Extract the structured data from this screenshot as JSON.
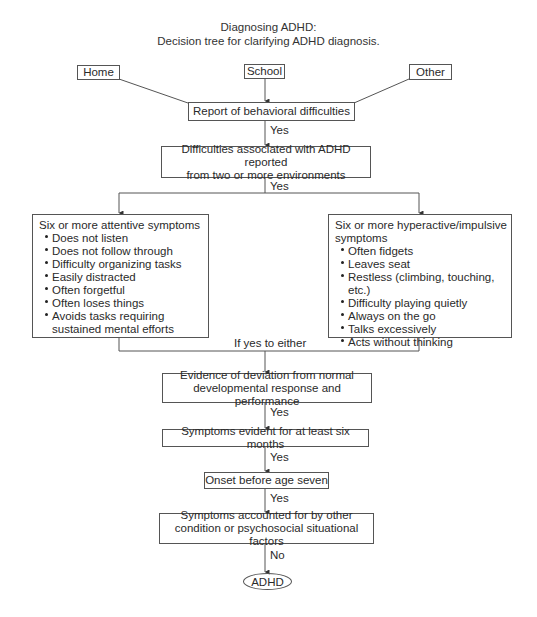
{
  "title": {
    "line1": "Diagnosing ADHD:",
    "line2": "Decision tree for clarifying ADHD diagnosis."
  },
  "sources": {
    "home": "Home",
    "school": "School",
    "other": "Other"
  },
  "nodes": {
    "report": "Report of behavioral difficulties",
    "environments": {
      "line1": "Difficulties associated with ADHD reported",
      "line2": "from two or more environments"
    },
    "attentive": {
      "heading": "Six or more attentive symptoms",
      "items": [
        "Does not listen",
        "Does not follow through",
        "Difficulty organizing tasks",
        "Easily distracted",
        "Often forgetful",
        "Often loses things",
        "Avoids tasks requiring sustained mental efforts"
      ]
    },
    "hyperactive": {
      "heading": "Six or more hyperactive/impulsive symptoms",
      "items": [
        "Often fidgets",
        "Leaves seat",
        "Restless (climbing, touching, etc.)",
        "Difficulty playing quietly",
        "Always on the go",
        "Talks excessively",
        "Acts without thinking"
      ]
    },
    "deviation": {
      "line1": "Evidence of deviation from normal",
      "line2": "developmental response and performance"
    },
    "six_months": "Symptoms evident for at least six months",
    "onset": "Onset before age seven",
    "other_factors": {
      "line1": "Symptoms accounted for by other",
      "line2": "condition or psychosocial situational factors"
    },
    "result": "ADHD"
  },
  "edge_labels": {
    "yes1": "Yes",
    "yes2": "Yes",
    "either": "If yes to either",
    "yes3": "Yes",
    "yes4": "Yes",
    "yes5": "Yes",
    "no": "No"
  },
  "colors": {
    "line": "#555555",
    "text": "#2a2a2a",
    "background": "#ffffff"
  }
}
